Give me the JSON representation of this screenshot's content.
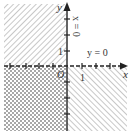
{
  "diagram": {
    "axes": {
      "x_label": "x",
      "y_label": "y",
      "origin_label": "O",
      "x_tick_label": "1",
      "y_tick_label": "1"
    },
    "lines": [
      {
        "label": "y = 0",
        "style": "dashed"
      },
      {
        "label": "x = 0",
        "style": "solid"
      }
    ],
    "regions": [
      {
        "quadrant": "II",
        "fill": "diagonal-hatch"
      },
      {
        "quadrant": "III",
        "fill": "cross-hatch"
      },
      {
        "quadrant": "IV",
        "fill": "diagonal-hatch-reverse"
      },
      {
        "quadrant": "I",
        "fill": "none"
      }
    ],
    "colors": {
      "hatch": "#9a9a9a",
      "axis": "#222222"
    }
  }
}
